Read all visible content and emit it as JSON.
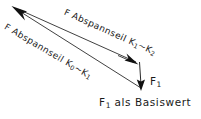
{
  "figure": {
    "type": "force-vector-diagram",
    "width": 201,
    "height": 119,
    "background_color": "#ffffff",
    "stroke_color": "#1a1a1a",
    "labels": {
      "upper_cable": {
        "prefix": "F",
        "body": " Abspannseil K",
        "sub1": "1",
        "tilde": "~K",
        "sub2": "2",
        "full": "F Abspannseil K1~K2",
        "rotation_deg": 24.2
      },
      "lower_cable": {
        "prefix": "F",
        "body": " Abspannseil K",
        "sub1": "0",
        "tilde": "~K",
        "sub2": "1",
        "full": "F Abspannseil K0~K1",
        "rotation_deg": 30.5
      },
      "resultant": {
        "prefix": "F",
        "sub": "1",
        "full": "F1"
      },
      "caption": {
        "prefix": "F",
        "sub": "1",
        "rest": " als Basiswert",
        "full": "F1 als Basiswert"
      }
    },
    "vectors": [
      {
        "name": "upper-cable-vector",
        "label_ref": "upper_cable",
        "from": [
          136,
          62
        ],
        "to": [
          13,
          7
        ],
        "arrow_at": "to"
      },
      {
        "name": "lower-cable-vector",
        "label_ref": "lower_cable",
        "from": [
          141,
          88
        ],
        "to": [
          13,
          7
        ],
        "arrow_at": "to"
      },
      {
        "name": "upper-cable-arrowhead-at-tail",
        "from": [
          120,
          56
        ],
        "to": [
          136,
          63
        ],
        "arrow_at": "to"
      },
      {
        "name": "resultant-vertical-vector",
        "label_ref": "resultant",
        "from": [
          139,
          62
        ],
        "to": [
          141,
          89
        ],
        "arrow_at": "to"
      }
    ]
  }
}
